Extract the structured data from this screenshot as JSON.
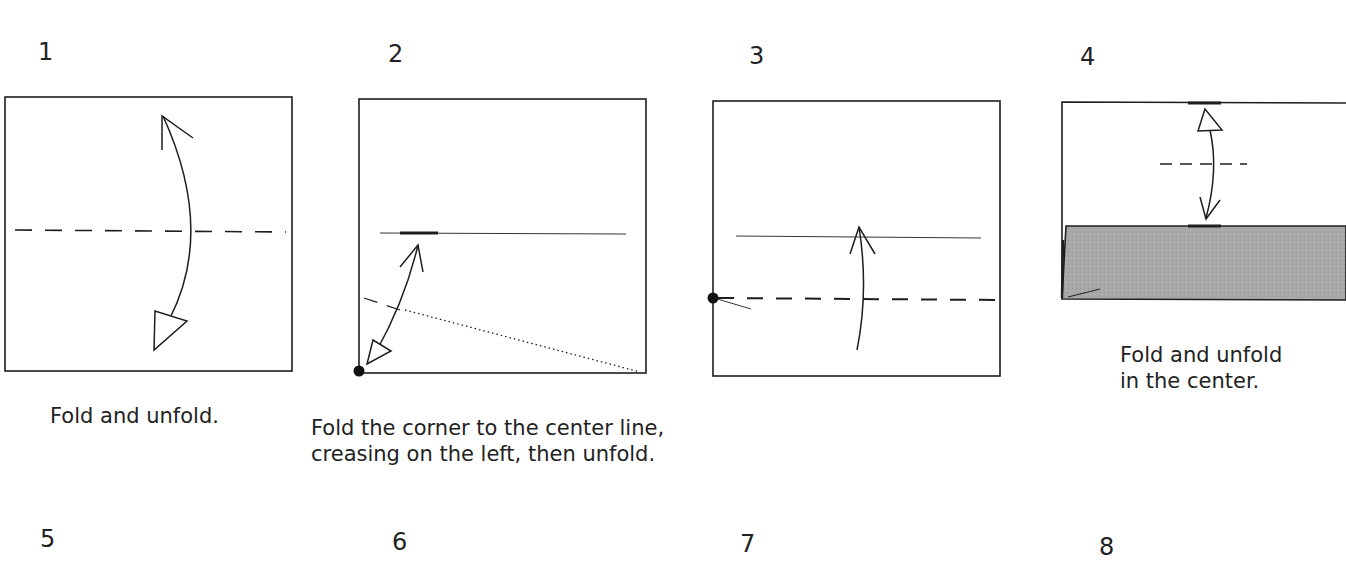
{
  "colors": {
    "ink": "#1e1e1e",
    "paper": "#ffffff",
    "colored_side": "#a8a8a8"
  },
  "steps": [
    {
      "number": "1",
      "caption": "Fold and unfold."
    },
    {
      "number": "2",
      "caption": "Fold the corner to the center line,\ncreasing on the left, then unfold."
    },
    {
      "number": "3",
      "caption": ""
    },
    {
      "number": "4",
      "caption": "Fold and unfold\nin the center."
    },
    {
      "number": "5",
      "caption": ""
    },
    {
      "number": "6",
      "caption": ""
    },
    {
      "number": "7",
      "caption": ""
    },
    {
      "number": "8",
      "caption": ""
    }
  ]
}
